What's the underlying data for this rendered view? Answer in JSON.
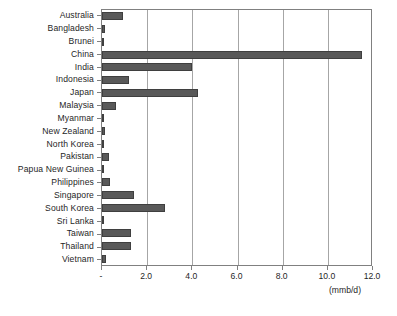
{
  "chart_data": {
    "type": "bar",
    "orientation": "horizontal",
    "title": "",
    "xlabel": "(mmb/d)",
    "ylabel": "",
    "xlim": [
      0,
      12
    ],
    "xticks": [
      "-",
      "2.0",
      "4.0",
      "6.0",
      "8.0",
      "10.0",
      "12.0"
    ],
    "xtick_values": [
      0,
      2,
      4,
      6,
      8,
      10,
      12
    ],
    "grid": true,
    "legend": false,
    "bar_color": "#595959",
    "bar_edge_color": "#3f3f3f",
    "axis_color": "#808080",
    "gridline_color": "#a6a6a6",
    "categories": [
      "Australia",
      "Bangladesh",
      "Brunei",
      "China",
      "India",
      "Indonesia",
      "Japan",
      "Malaysia",
      "Myanmar",
      "New Zealand",
      "North Korea",
      "Pakistan",
      "Papua New Guinea",
      "Philippines",
      "Singapore",
      "South Korea",
      "Sri Lanka",
      "Taiwan",
      "Thailand",
      "Vietnam"
    ],
    "values": [
      0.95,
      0.12,
      0.08,
      11.5,
      4.0,
      1.2,
      4.25,
      0.6,
      0.05,
      0.15,
      0.1,
      0.3,
      0.04,
      0.35,
      1.4,
      2.8,
      0.05,
      1.3,
      1.3,
      0.18
    ]
  }
}
